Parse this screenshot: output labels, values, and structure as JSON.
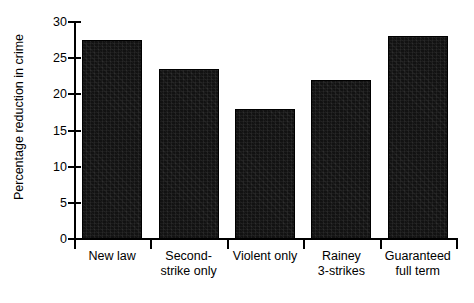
{
  "chart_data": {
    "type": "bar",
    "title": "",
    "xlabel": "",
    "ylabel": "Percentage reduction in crime",
    "categories": [
      "New law",
      "Second-strike only",
      "Violent only",
      "Rainey 3-strikes",
      "Guaranteed full term"
    ],
    "category_lines": [
      [
        "New law"
      ],
      [
        "Second-",
        "strike only"
      ],
      [
        "Violent only"
      ],
      [
        "Rainey",
        "3-strikes"
      ],
      [
        "Guaranteed",
        "full term"
      ]
    ],
    "values": [
      27.5,
      23.5,
      18.0,
      22.0,
      28.0
    ],
    "ylim": [
      0,
      30
    ],
    "ytick_labels": [
      "0",
      "5",
      "10",
      "15",
      "20",
      "25",
      "30"
    ],
    "ytick_values": [
      0,
      5,
      10,
      15,
      20,
      25,
      30
    ],
    "grid": false,
    "legend": null,
    "bar_color": "#121212",
    "axis_color": "#000000",
    "background": "#ffffff"
  }
}
